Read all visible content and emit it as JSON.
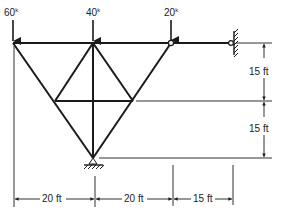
{
  "diagram": {
    "type": "truss",
    "loads": [
      {
        "label": "60",
        "unit": "k",
        "node": "A"
      },
      {
        "label": "40",
        "unit": "k",
        "node": "B"
      },
      {
        "label": "20",
        "unit": "k",
        "node": "C"
      }
    ],
    "dimensions": {
      "horizontal": [
        "20 ft",
        "20 ft",
        "15 ft"
      ],
      "vertical": [
        "15 ft",
        "15 ft"
      ]
    },
    "supports": {
      "wall": "fixed-wall-pin",
      "bottom": "ground-pin"
    },
    "colors": {
      "member": "#1a1a1a",
      "text": "#222222",
      "background": "#ffffff"
    }
  }
}
